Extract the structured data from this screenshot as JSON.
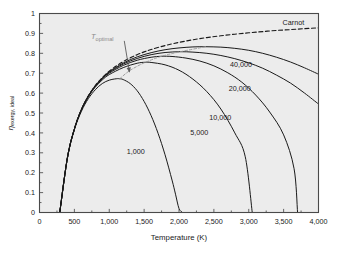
{
  "chart_data": {
    "type": "line",
    "title": "",
    "xlabel": "Temperature (K)",
    "ylabel_main": "η",
    "ylabel_sub": "exergy, ideal",
    "xlim": [
      0,
      4000
    ],
    "ylim": [
      0,
      1
    ],
    "grid": false,
    "legend": "inline-curve-labels",
    "background_color": "#ececec",
    "frame_color": "#4a4a4a",
    "curve_color": "#1a1a1a",
    "annotation_color": "#8a8a8a",
    "xticks": [
      0,
      500,
      1000,
      1500,
      2000,
      2500,
      3000,
      3500,
      4000
    ],
    "xtick_labels": [
      "0",
      "500",
      "1,000",
      "1,500",
      "2,000",
      "2,500",
      "3,000",
      "3,500",
      "4,000"
    ],
    "yticks": [
      0,
      0.1,
      0.2,
      0.3,
      0.4,
      0.5,
      0.6,
      0.7,
      0.8,
      0.9,
      1
    ],
    "ytick_labels": [
      "0",
      "0.1",
      "0.2",
      "0.3",
      "0.4",
      "0.5",
      "0.6",
      "0.7",
      "0.8",
      "0.9",
      "1"
    ],
    "annotations": [
      {
        "name": "t-optimal",
        "text": "T",
        "sub": "optimal",
        "x": 900,
        "y": 0.885,
        "style": "gray-with-leader-arrow"
      }
    ],
    "series": [
      {
        "name": "Carnot",
        "label": "Carnot",
        "style": "dashed",
        "label_x": 3640,
        "label_y": 0.955,
        "x": [
          290,
          400,
          500,
          600,
          700,
          800,
          900,
          1000,
          1100,
          1200,
          1300,
          1400,
          1500,
          1600,
          1800,
          2000,
          2200,
          2400,
          2600,
          2800,
          3000,
          3200,
          3400,
          3600,
          3800,
          4000
        ],
        "y": [
          0.0,
          0.275,
          0.42,
          0.517,
          0.586,
          0.638,
          0.678,
          0.71,
          0.736,
          0.758,
          0.777,
          0.793,
          0.807,
          0.819,
          0.839,
          0.855,
          0.868,
          0.879,
          0.888,
          0.896,
          0.903,
          0.909,
          0.915,
          0.919,
          0.924,
          0.928
        ]
      },
      {
        "name": "concentration-1000",
        "label": "1,000",
        "style": "solid",
        "label_x": 1380,
        "label_y": 0.305,
        "peak": {
          "x": 1150,
          "y": 0.672
        },
        "zero_crossing": 2050,
        "x": [
          290,
          400,
          500,
          600,
          700,
          800,
          900,
          1000,
          1100,
          1150,
          1200,
          1300,
          1400,
          1500,
          1600,
          1700,
          1800,
          1900,
          1950,
          2000,
          2050
        ],
        "y": [
          0.0,
          0.272,
          0.415,
          0.508,
          0.572,
          0.617,
          0.648,
          0.665,
          0.672,
          0.672,
          0.668,
          0.648,
          0.612,
          0.558,
          0.487,
          0.398,
          0.29,
          0.163,
          0.092,
          0.02,
          0.0
        ]
      },
      {
        "name": "concentration-5000",
        "label": "5,000",
        "style": "solid",
        "label_x": 2290,
        "label_y": 0.405,
        "peak": {
          "x": 1520,
          "y": 0.755
        },
        "zero_crossing": 3050,
        "x": [
          290,
          400,
          500,
          600,
          700,
          800,
          900,
          1000,
          1200,
          1400,
          1520,
          1600,
          1800,
          2000,
          2200,
          2400,
          2600,
          2800,
          2950,
          3050
        ],
        "y": [
          0.0,
          0.274,
          0.419,
          0.514,
          0.581,
          0.63,
          0.666,
          0.693,
          0.728,
          0.75,
          0.755,
          0.754,
          0.742,
          0.715,
          0.67,
          0.607,
          0.52,
          0.4,
          0.28,
          0.0
        ]
      },
      {
        "name": "concentration-10000",
        "label": "10,000",
        "style": "solid",
        "label_x": 2590,
        "label_y": 0.48,
        "peak": {
          "x": 1750,
          "y": 0.785
        },
        "zero_crossing": 3700,
        "x": [
          290,
          400,
          500,
          600,
          700,
          800,
          900,
          1000,
          1200,
          1400,
          1600,
          1750,
          1900,
          2100,
          2300,
          2500,
          2700,
          2900,
          3100,
          3300,
          3500,
          3650,
          3700
        ],
        "y": [
          0.0,
          0.275,
          0.42,
          0.516,
          0.584,
          0.634,
          0.671,
          0.7,
          0.739,
          0.765,
          0.78,
          0.785,
          0.784,
          0.776,
          0.761,
          0.737,
          0.702,
          0.655,
          0.59,
          0.505,
          0.39,
          0.22,
          0.0
        ]
      },
      {
        "name": "concentration-20000",
        "label": "20,000",
        "style": "solid",
        "label_x": 2870,
        "label_y": 0.625,
        "peak": {
          "x": 2020,
          "y": 0.808
        },
        "x": [
          290,
          400,
          500,
          600,
          700,
          800,
          900,
          1000,
          1200,
          1400,
          1600,
          1800,
          2020,
          2200,
          2400,
          2600,
          2800,
          3000,
          3200,
          3400,
          3600,
          3800,
          4000
        ],
        "y": [
          0.0,
          0.275,
          0.42,
          0.517,
          0.585,
          0.636,
          0.674,
          0.704,
          0.746,
          0.774,
          0.793,
          0.804,
          0.808,
          0.806,
          0.8,
          0.789,
          0.773,
          0.752,
          0.725,
          0.69,
          0.65,
          0.6,
          0.545
        ]
      },
      {
        "name": "concentration-40000",
        "label": "40,000",
        "style": "solid",
        "label_x": 2890,
        "label_y": 0.745,
        "peak": {
          "x": 2380,
          "y": 0.833
        },
        "x": [
          290,
          400,
          500,
          600,
          700,
          800,
          900,
          1000,
          1200,
          1400,
          1600,
          1800,
          2000,
          2200,
          2380,
          2600,
          2800,
          3000,
          3200,
          3400,
          3600,
          3800,
          4000
        ],
        "y": [
          0.0,
          0.275,
          0.42,
          0.517,
          0.586,
          0.637,
          0.676,
          0.707,
          0.751,
          0.782,
          0.803,
          0.818,
          0.827,
          0.832,
          0.833,
          0.831,
          0.825,
          0.815,
          0.8,
          0.78,
          0.756,
          0.727,
          0.695
        ]
      },
      {
        "name": "t-optimal-locus",
        "label": "",
        "style": "dashed-gray",
        "x": [
          1150,
          1250,
          1350,
          1520,
          1750,
          2020,
          2380
        ],
        "y": [
          0.672,
          0.702,
          0.725,
          0.755,
          0.785,
          0.808,
          0.833
        ]
      }
    ]
  }
}
